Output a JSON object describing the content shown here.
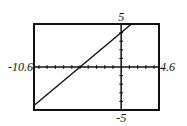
{
  "chart_data": {
    "type": "line",
    "title": "",
    "xlabel": "",
    "ylabel": "",
    "xlim": [
      -10.6,
      4.6
    ],
    "ylim": [
      -5,
      5
    ],
    "grid": false,
    "tick_spacing": {
      "x": 1,
      "y": 1
    },
    "window_labels": {
      "xmin": "-10.6",
      "xmax": "4.6",
      "ymin": "-5",
      "ymax": "5"
    },
    "series": [
      {
        "name": "y = 0.8x + 4",
        "slope": 0.8,
        "intercept": 4,
        "x": [
          -10.6,
          1.25
        ],
        "y": [
          -4.48,
          5
        ]
      }
    ],
    "annotations": {
      "x_intercept": -5,
      "y_intercept": 4
    }
  },
  "colors": {
    "frame": "#111111",
    "axes": "#111111",
    "line": "#111111",
    "background": "#ffffff"
  }
}
